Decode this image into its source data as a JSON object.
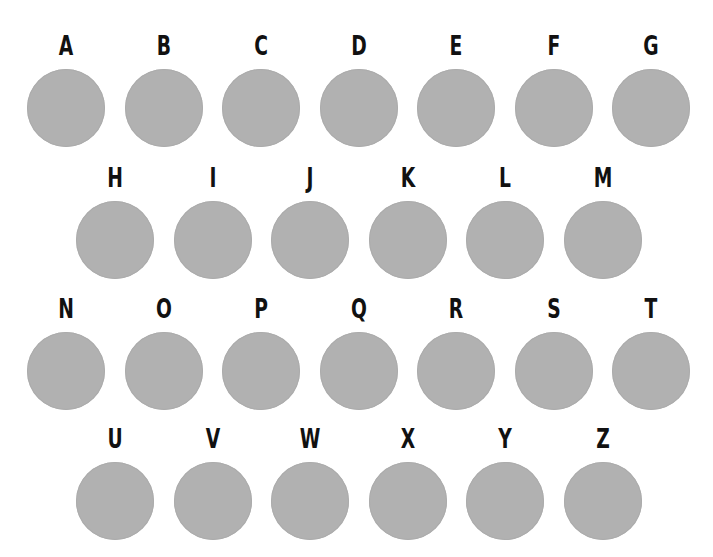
{
  "board": {
    "fill_color": "#b1b1b1",
    "label_color": "#111111",
    "rows": [
      {
        "label_top": 33,
        "items": [
          {
            "letter": "A",
            "cx": 66
          },
          {
            "letter": "B",
            "cx": 163.5
          },
          {
            "letter": "C",
            "cx": 261
          },
          {
            "letter": "D",
            "cx": 358.5
          },
          {
            "letter": "E",
            "cx": 456
          },
          {
            "letter": "F",
            "cx": 553.5
          },
          {
            "letter": "G",
            "cx": 651
          }
        ]
      },
      {
        "label_top": 165,
        "items": [
          {
            "letter": "H",
            "cx": 115
          },
          {
            "letter": "I",
            "cx": 212.5
          },
          {
            "letter": "J",
            "cx": 310
          },
          {
            "letter": "K",
            "cx": 407.5
          },
          {
            "letter": "L",
            "cx": 505
          },
          {
            "letter": "M",
            "cx": 602.5
          }
        ]
      },
      {
        "label_top": 296,
        "items": [
          {
            "letter": "N",
            "cx": 66
          },
          {
            "letter": "O",
            "cx": 163.5
          },
          {
            "letter": "P",
            "cx": 261
          },
          {
            "letter": "Q",
            "cx": 358.5
          },
          {
            "letter": "R",
            "cx": 456
          },
          {
            "letter": "S",
            "cx": 553.5
          },
          {
            "letter": "T",
            "cx": 651
          }
        ]
      },
      {
        "label_top": 425,
        "items": [
          {
            "letter": "U",
            "cx": 115
          },
          {
            "letter": "V",
            "cx": 212.5
          },
          {
            "letter": "W",
            "cx": 310
          },
          {
            "letter": "X",
            "cx": 407.5
          },
          {
            "letter": "Y",
            "cx": 505
          },
          {
            "letter": "Z",
            "cx": 602.5
          }
        ]
      }
    ]
  }
}
